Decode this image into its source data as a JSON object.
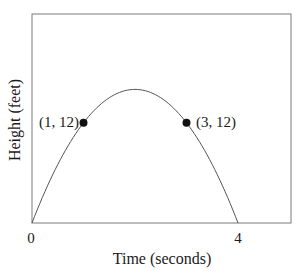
{
  "chart_data": {
    "type": "line",
    "title": "",
    "xlabel": "Time (seconds)",
    "ylabel": "Height (feet)",
    "x_ticks": [
      "0",
      "4"
    ],
    "xlim": [
      0,
      5
    ],
    "ylim": [
      0,
      25
    ],
    "grid": false,
    "legend": null,
    "series": [
      {
        "name": "trajectory",
        "function": "h(t) = -4t^2 + 16t",
        "x": [
          0,
          0.5,
          1,
          1.5,
          2,
          2.5,
          3,
          3.5,
          4
        ],
        "y": [
          0,
          7,
          12,
          15,
          16,
          15,
          12,
          7,
          0
        ]
      }
    ],
    "annotations": [
      {
        "label": "(1, 12)",
        "x": 1,
        "y": 12
      },
      {
        "label": "(3, 12)",
        "x": 3,
        "y": 12
      }
    ]
  },
  "labels": {
    "xlabel": "Time (seconds)",
    "ylabel": "Height (feet)",
    "tick_0": "0",
    "tick_4": "4",
    "point_1": "(1, 12)",
    "point_3": "(3, 12)"
  },
  "colors": {
    "curve": "#555555",
    "frame": "#7a7a7a",
    "point": "#111111"
  }
}
